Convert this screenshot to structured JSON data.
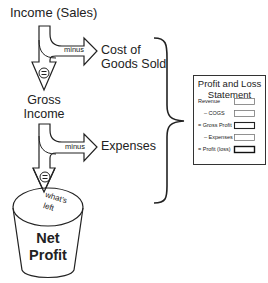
{
  "flow": {
    "income_label": "Income (Sales)",
    "step1": {
      "operator": "minus",
      "target": [
        "Cost of",
        "Goods Sold"
      ],
      "result_symbol": "="
    },
    "gross_income": [
      "Gross",
      "Income"
    ],
    "step2": {
      "operator": "minus",
      "target": "Expenses",
      "result_symbol": "="
    },
    "whats_left": [
      "what's",
      "left"
    ],
    "bucket_label": [
      "Net",
      "Profit"
    ]
  },
  "statement": {
    "title": [
      "Profit and Loss",
      "Statement"
    ],
    "rows": [
      {
        "label": "Revenue",
        "bold_box": false
      },
      {
        "label": "– COGS",
        "bold_box": false
      },
      {
        "label": "= Gross Profit",
        "bold_box": true
      },
      {
        "label": "– Expenses",
        "bold_box": false
      },
      {
        "label": "= Profit (loss)",
        "bold_box": true
      }
    ]
  }
}
